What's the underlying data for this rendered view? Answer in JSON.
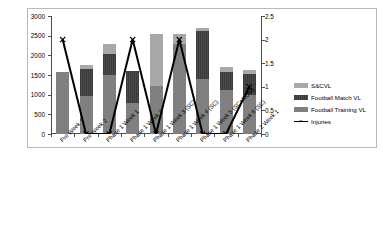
{
  "chart_data": {
    "type": "bar",
    "title": "",
    "xlabel": "",
    "ylabel": "",
    "y2label": "",
    "grid": false,
    "legend_position": "right",
    "categories": [
      "Pre Week 1",
      "Pre Week 2",
      "Phase 1 Week 1",
      "Phase 1 Week 2",
      "Phase 1 Week 3 (SC)",
      "Phase 1 Week 4 (SC)",
      "Phase 1 Week 5 (SC+ROM)",
      "Phase 1 Week 6 (SC)",
      "Phase 2 Week 1"
    ],
    "ylim": [
      0,
      3000
    ],
    "yticks": [
      0,
      500,
      1000,
      1500,
      2000,
      2500,
      3000
    ],
    "ytick_labels": [
      "0",
      "500",
      "1000",
      "1500",
      "2000",
      "2500",
      "3000"
    ],
    "y2lim": [
      0,
      2.5
    ],
    "y2ticks": [
      0,
      0.5,
      1,
      1.5,
      2,
      2.5
    ],
    "y2tick_labels": [
      "0",
      "0.5",
      "1",
      "1.5",
      "2",
      "2.5"
    ],
    "stacked": true,
    "series": [
      {
        "name": "Football Training VL",
        "axis": "left",
        "color": "#808080",
        "values": [
          1580,
          970,
          1500,
          780,
          1220,
          2280,
          1390,
          1130,
          1000
        ]
      },
      {
        "name": "Football Match VL",
        "axis": "left",
        "color": "#404040",
        "values": [
          0,
          690,
          530,
          820,
          0,
          0,
          1230,
          440,
          520
        ]
      },
      {
        "name": "S&C VL",
        "axis": "left",
        "color": "#a8a8a8",
        "values": [
          0,
          90,
          250,
          0,
          1320,
          270,
          80,
          140,
          110
        ]
      },
      {
        "name": "Injuries",
        "axis": "right",
        "color": "#000000",
        "marker": "x",
        "values": [
          2,
          0,
          0,
          2,
          0,
          2,
          0,
          0,
          1
        ]
      }
    ],
    "bar_totals": [
      1580,
      1750,
      2280,
      1600,
      2540,
      2550,
      2700,
      1710,
      1630
    ]
  },
  "legend": {
    "items": [
      {
        "label": "S&CVL",
        "swatch": "sc-swatch"
      },
      {
        "label": "Football Match VL",
        "swatch": "match-swatch"
      },
      {
        "label": "Football Training VL",
        "swatch": "training-swatch"
      },
      {
        "label": "Injuries",
        "swatch": "injuries-line-marker"
      }
    ]
  }
}
